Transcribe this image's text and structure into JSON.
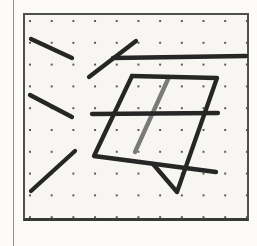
{
  "page": {
    "background_color": "#fcfbf9",
    "edge_line_color": "#8f8f8f"
  },
  "canvas": {
    "frame": {
      "x": 23,
      "y": 13,
      "width": 226,
      "height": 208,
      "border_color": "#4f4f4f",
      "bottom_border_color": "#383838",
      "background_color": "#f7f6f2"
    },
    "grid": {
      "type": "dot-grid",
      "origin_x": 30,
      "origin_y": 21,
      "spacing_x": 21.7,
      "spacing_y": 21.8,
      "dot_color": "#5a5a5a"
    }
  },
  "drawing": {
    "depicted_character": "海",
    "ink_color": "#262626",
    "accent_ink_color": "#7a7a7a",
    "stroke_width": 4.3,
    "strokes": [
      {
        "name": "center-vertical",
        "color": "accent",
        "points": [
          [
            169,
            77
          ],
          [
            135,
            152
          ]
        ]
      },
      {
        "name": "water-dot-top",
        "color": "ink",
        "points": [
          [
            31,
            39
          ],
          [
            72,
            58
          ]
        ]
      },
      {
        "name": "water-dot-middle",
        "color": "ink",
        "points": [
          [
            30,
            95
          ],
          [
            72,
            117
          ]
        ]
      },
      {
        "name": "water-rising-dot",
        "color": "ink",
        "points": [
          [
            31,
            191
          ],
          [
            75,
            151
          ]
        ]
      },
      {
        "name": "upper-slant",
        "color": "ink",
        "points": [
          [
            89,
            77
          ],
          [
            136,
            41
          ]
        ]
      },
      {
        "name": "top-horizontal",
        "color": "ink",
        "points": [
          [
            113,
            58
          ],
          [
            246,
            56
          ]
        ]
      },
      {
        "name": "vertical-fold",
        "color": "ink",
        "points": [
          [
            132,
            76
          ],
          [
            94,
            156
          ],
          [
            216,
            172
          ]
        ]
      },
      {
        "name": "horizontal-fold-hook",
        "color": "ink",
        "points": [
          [
            132,
            76
          ],
          [
            217,
            78
          ],
          [
            177,
            192
          ],
          [
            153,
            164
          ]
        ]
      },
      {
        "name": "middle-horizontal",
        "color": "ink",
        "points": [
          [
            92,
            114
          ],
          [
            218,
            113
          ]
        ]
      }
    ]
  }
}
